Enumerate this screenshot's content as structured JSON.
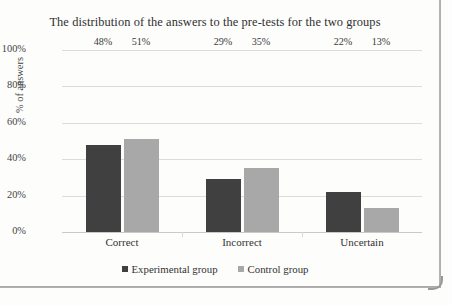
{
  "chart_data": {
    "type": "bar",
    "title": "The distribution of the answers to the pre-tests for the two groups",
    "xlabel": "",
    "ylabel": "% of answers",
    "categories": [
      "Correct",
      "Incorrect",
      "Uncertain"
    ],
    "series": [
      {
        "name": "Experimental group",
        "color": "#404040",
        "values": [
          48,
          29,
          22
        ],
        "labels": [
          "48%",
          "29%",
          "22%"
        ]
      },
      {
        "name": "Control group",
        "color": "#a8a8a8",
        "values": [
          51,
          35,
          13
        ],
        "labels": [
          "51%",
          "35%",
          "13%"
        ]
      }
    ],
    "ylim": [
      0,
      100
    ],
    "yticks": [
      100,
      80,
      60,
      40,
      20,
      0
    ],
    "ytick_labels": [
      "100%",
      "80%",
      "60%",
      "40%",
      "20%",
      "0%"
    ],
    "grid": true,
    "legend_position": "bottom"
  }
}
